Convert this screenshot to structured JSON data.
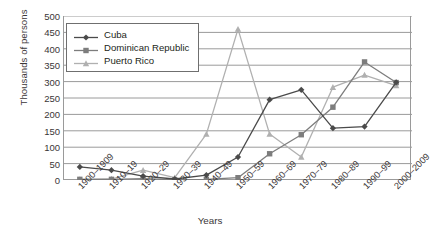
{
  "chart_data": {
    "type": "line",
    "title": "",
    "xlabel": "Years",
    "ylabel": "Thousands of persons",
    "categories": [
      "1900–1909",
      "1910–19",
      "1920–29",
      "1930–39",
      "1940–49",
      "1950–59",
      "1960–69",
      "1970–79",
      "1980–89",
      "1990–99",
      "2000–2009"
    ],
    "ylim": [
      0,
      500
    ],
    "yticks": [
      0,
      50,
      100,
      150,
      200,
      250,
      300,
      350,
      400,
      450,
      500
    ],
    "grid": "horizontal",
    "legend_position": "top-left-inside",
    "series": [
      {
        "name": "Cuba",
        "marker": "diamond",
        "color": "#4a4a4a",
        "values": [
          40,
          30,
          12,
          3,
          15,
          70,
          245,
          275,
          158,
          163,
          298
        ]
      },
      {
        "name": "Dominican Republic",
        "marker": "square",
        "color": "#7d7d7d",
        "values": [
          2,
          2,
          4,
          1,
          2,
          7,
          80,
          138,
          222,
          360,
          297
        ]
      },
      {
        "name": "Puerto Rico",
        "marker": "triangle",
        "color": "#b0b0b0",
        "values": [
          2,
          3,
          30,
          7,
          140,
          460,
          140,
          70,
          283,
          320,
          288
        ]
      }
    ]
  },
  "colors": {
    "axis": "#9a9a9a",
    "gridline": "#9a9a9a",
    "text": "#3a3637",
    "legend_border": "#6f6f6f",
    "background": "#ffffff"
  }
}
